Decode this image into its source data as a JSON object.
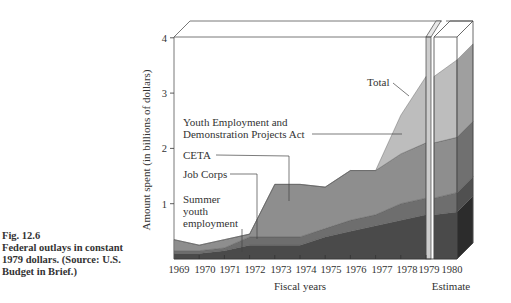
{
  "caption": {
    "fig": "Fig. 12.6",
    "lines": [
      "Federal outlays in constant",
      "1979 dollars. (Source: U.S.",
      "Budget in Brief.)"
    ]
  },
  "chart_data": {
    "type": "area",
    "stacked": true,
    "title": "",
    "xlabel": "Fiscal years",
    "ylabel": "Amount spent (in billions of dollars)",
    "ylim": [
      0,
      4
    ],
    "yticks": [
      1,
      2,
      3,
      4
    ],
    "categories": [
      "1969",
      "1970",
      "1971",
      "1972",
      "1973",
      "1974",
      "1975",
      "1976",
      "1977",
      "1978",
      "1979",
      "1980"
    ],
    "estimate_label": "Estimate",
    "estimate_categories": [
      "1980"
    ],
    "series": [
      {
        "name": "Summer youth employment",
        "values": [
          0.1,
          0.1,
          0.15,
          0.25,
          0.25,
          0.25,
          0.4,
          0.5,
          0.6,
          0.7,
          0.8,
          0.85
        ],
        "color": "#4a4a4a"
      },
      {
        "name": "Job Corps",
        "values": [
          0.05,
          0.05,
          0.05,
          0.15,
          0.15,
          0.15,
          0.15,
          0.2,
          0.2,
          0.3,
          0.3,
          0.35
        ],
        "color": "#6e6e6e"
      },
      {
        "name": "CETA",
        "values": [
          0.2,
          0.1,
          0.15,
          0.05,
          0.95,
          0.95,
          0.75,
          0.9,
          0.8,
          0.9,
          1.0,
          1.0
        ],
        "color": "#8e8e8e"
      },
      {
        "name": "Youth Employment and Demonstration Projects Act",
        "values": [
          0,
          0,
          0,
          0,
          0,
          0,
          0,
          0,
          0,
          0.7,
          1.2,
          1.4
        ],
        "color": "#bdbdbd"
      }
    ],
    "totals": [
      0.35,
      0.25,
      0.35,
      0.45,
      1.35,
      1.35,
      1.3,
      1.6,
      1.6,
      2.6,
      3.3,
      3.6
    ],
    "annotations": [
      "Total",
      "Youth Employment and Demonstration Projects Act",
      "CETA",
      "Job Corps",
      "Summer youth employment"
    ],
    "grid": false,
    "legend": "inline-labels"
  },
  "labels": {
    "total": "Total",
    "yedpa_1": "Youth Employment and",
    "yedpa_2": "Demonstration Projects Act",
    "ceta": "CETA",
    "job_corps": "Job Corps",
    "summer_1": "Summer",
    "summer_2": "youth",
    "summer_3": "employment",
    "xlabel": "Fiscal years",
    "ylabel": "Amount spent (in billions of dollars)",
    "estimate": "Estimate",
    "years": [
      "1969",
      "1970",
      "1971",
      "1972",
      "1973",
      "1974",
      "1975",
      "1976",
      "1977",
      "1978",
      "1979",
      "1980"
    ],
    "yticks": [
      "1",
      "2",
      "3",
      "4"
    ]
  }
}
